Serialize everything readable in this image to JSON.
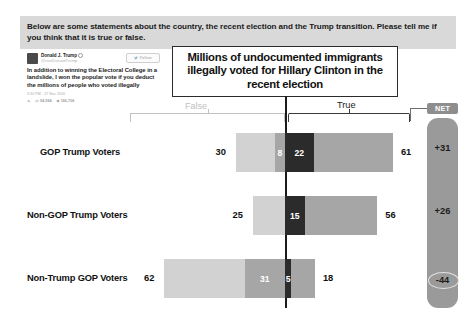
{
  "banner": {
    "text": "Below are some statements about the country, the recent election and the Trump transition. Please tell me if you think that it is true or false."
  },
  "tweet": {
    "display_name": "Donald J. Trump",
    "handle": "@realDonaldTrump",
    "follow_label": "Follow",
    "body": "In addition to winning the Electoral College in a landslide, I won the popular vote if you deduct the millions of people who voted illegally",
    "timestamp": "3:30 PM - 27 Nov 2016",
    "retweets": "54,994",
    "likes": "160,706"
  },
  "statement": {
    "text": "Millions of undocumented immigrants illegally voted for Hillary Clinton in the recent election"
  },
  "axis_labels": {
    "false_label": "False",
    "true_label": "True",
    "net_label": "NET"
  },
  "colors": {
    "banner_bg": "#d9d9d9",
    "light_gray": "#d2d2d2",
    "mid_gray": "#a6a6a6",
    "dark": "#2b2b2b",
    "net_bg": "#9a9a9a",
    "axis": "#1b1b1b"
  },
  "chart_data": {
    "type": "bar",
    "title": "Millions of undocumented immigrants illegally voted for Hillary Clinton in the recent election",
    "xlabel": "",
    "ylabel": "",
    "orientation": "horizontal",
    "stacked": true,
    "legend_position": "top",
    "grid": false,
    "categories": [
      "GOP Trump Voters",
      "Non-GOP Trump Voters",
      "Non-Trump GOP Voters"
    ],
    "series": [
      {
        "name": "False",
        "values": [
          30,
          25,
          62
        ]
      },
      {
        "name": "Probably false",
        "values": [
          8,
          0,
          31
        ]
      },
      {
        "name": "Not sure",
        "values": [
          22,
          15,
          5
        ]
      },
      {
        "name": "True",
        "values": [
          61,
          56,
          18
        ]
      }
    ],
    "net": [
      "+31",
      "+26",
      "-44"
    ],
    "net_highlight_index": 2,
    "rows": [
      {
        "label": "GOP Trump Voters",
        "left_value": "30",
        "mid_left_value": "8",
        "center_value": "22",
        "right_value": "61",
        "net": "+31"
      },
      {
        "label": "Non-GOP Trump Voters",
        "left_value": "25",
        "mid_left_value": "",
        "center_value": "15",
        "right_value": "56",
        "net": "+26"
      },
      {
        "label": "Non-Trump GOP Voters",
        "left_value": "62",
        "mid_left_value": "31",
        "center_value": "5",
        "right_value": "18",
        "net": "-44"
      }
    ]
  }
}
